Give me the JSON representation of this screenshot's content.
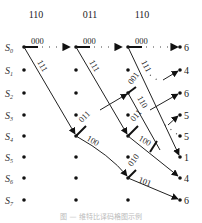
{
  "diagram": {
    "type": "trellis",
    "input_headers": [
      "110",
      "011",
      "110"
    ],
    "states": [
      "S",
      "S",
      "S",
      "S",
      "S",
      "S",
      "S",
      "S"
    ],
    "state_subscripts": [
      "0",
      "1",
      "2",
      "3",
      "4",
      "5",
      "6",
      "7"
    ],
    "branch_labels": {
      "c1_s0_to_c2_s0": "000",
      "c1_s0_to_c2_s4": "111",
      "c2_s0_to_c3_s0": "000",
      "c2_s0_to_c3_s4": "111",
      "c2_s4_stub": "011",
      "c2_s4_to_c3_s6": "100",
      "c3_s0_to_c4_s0": "000",
      "c3_s0_to_c4_s4": "111",
      "c3_s2": "001",
      "c3_s2_stub": "110",
      "c3_s4_stub": "011",
      "c3_s4_to_c4": "100",
      "c3_s6_stub": "010",
      "c3_s6_to_c4_s7": "101"
    },
    "path_metrics": [
      "6",
      "4",
      "6",
      "5",
      "5",
      "1",
      "4",
      "6"
    ],
    "caption": "图 — 维特比译码格图示例"
  }
}
